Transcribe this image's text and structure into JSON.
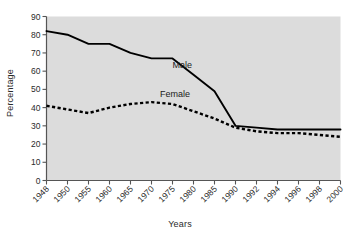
{
  "chart_data": {
    "type": "line",
    "title": "",
    "xlabel": "Years",
    "ylabel": "Percentage",
    "ylim": [
      0,
      90
    ],
    "ytick_step": 10,
    "yticks": [
      0,
      10,
      20,
      30,
      40,
      50,
      60,
      70,
      80,
      90
    ],
    "grid": false,
    "legend_position": "inline-annotation",
    "categories": [
      "1948",
      "1950",
      "1955",
      "1960",
      "1965",
      "1970",
      "1975",
      "1980",
      "1985",
      "1990",
      "1992",
      "1994",
      "1996",
      "1998",
      "2000"
    ],
    "series": [
      {
        "name": "Male",
        "style": "solid",
        "color": "#000000",
        "values": [
          82,
          80,
          75,
          75,
          70,
          67,
          67,
          58,
          49,
          30,
          29,
          28,
          28,
          28,
          28
        ]
      },
      {
        "name": "Female",
        "style": "dashed",
        "color": "#000000",
        "values": [
          41,
          39,
          37,
          40,
          42,
          43,
          42,
          38,
          34,
          29,
          27,
          26,
          26,
          25,
          24
        ]
      }
    ],
    "annotations": [
      {
        "text": "Male",
        "x_value": "1975",
        "y_value": 62
      },
      {
        "text": "Female",
        "x_value": "1972",
        "y_value": 46
      }
    ],
    "colors": {
      "plot_background": "#dcdcdc",
      "page_background": "#ffffff",
      "axis": "#555555",
      "text": "#2b2b2b",
      "series_line": "#000000"
    }
  }
}
